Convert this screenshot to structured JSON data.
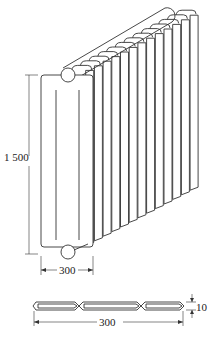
{
  "diagram": {
    "views": [
      {
        "name": "isometric-view",
        "fin_count": 14,
        "dimensions": {
          "height_label": "1 500",
          "width_label": "300"
        }
      },
      {
        "name": "cross-section-view",
        "chamber_count": 3,
        "dimensions": {
          "width_label": "300",
          "thickness_label": "10"
        }
      }
    ]
  }
}
